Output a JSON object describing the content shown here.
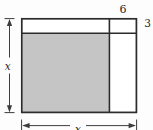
{
  "figure": {
    "labels": {
      "top_segment_width": "6",
      "right_segment_height": "3",
      "left_dimension": "x",
      "bottom_dimension": "x"
    },
    "colors": {
      "shaded_region": "#c5c5c5",
      "outline": "#2b2b2b",
      "arrow": "#3d3d3d",
      "background": "#fdfdfd"
    }
  }
}
